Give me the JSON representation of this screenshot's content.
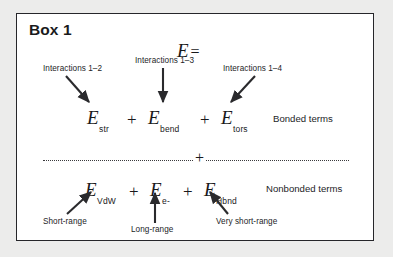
{
  "figure": {
    "title": "Box 1",
    "background_color": "#ececeb",
    "box_background": "#ffffff",
    "border_color": "#26262a",
    "text_color": "#19191b"
  },
  "equation": {
    "head_symbol": "E",
    "head_equals": "=",
    "operator": "+",
    "divider_operator": "+"
  },
  "bonded": {
    "category_label": "Bonded terms",
    "terms": [
      {
        "symbol": "E",
        "subscript": "str",
        "annotation": "Interactions 1–2"
      },
      {
        "symbol": "E",
        "subscript": "bend",
        "annotation": "Interactions 1–3"
      },
      {
        "symbol": "E",
        "subscript": "tors",
        "annotation": "Interactions 1–4"
      }
    ]
  },
  "nonbonded": {
    "category_label": "Nonbonded terms",
    "terms": [
      {
        "symbol": "E",
        "subscript": "VdW",
        "annotation": "Short-range"
      },
      {
        "symbol": "E",
        "subscript": "e-",
        "annotation": "Long-range"
      },
      {
        "symbol": "E",
        "subscript": "Hbnd",
        "annotation": "Very short-range"
      }
    ]
  }
}
